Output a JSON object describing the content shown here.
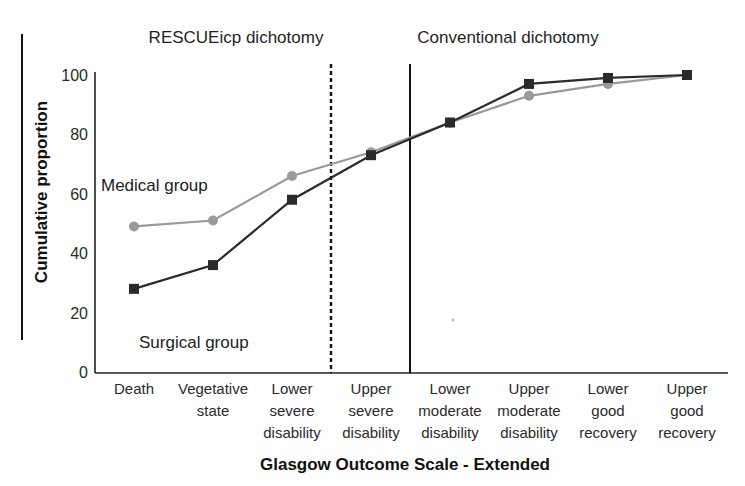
{
  "chart_data": {
    "type": "line",
    "title": "",
    "xlabel": "Glasgow Outcome Scale - Extended",
    "ylabel": "Cumulative proportion",
    "ylim": [
      0,
      100
    ],
    "yticks": [
      0,
      20,
      40,
      60,
      80,
      100
    ],
    "grid": false,
    "categories": [
      [
        "Death"
      ],
      [
        "Vegetative",
        "state"
      ],
      [
        "Lower",
        "severe",
        "disability"
      ],
      [
        "Upper",
        "severe",
        "disability"
      ],
      [
        "Lower",
        "moderate",
        "disability"
      ],
      [
        "Upper",
        "moderate",
        "disability"
      ],
      [
        "Lower",
        "good",
        "recovery"
      ],
      [
        "Upper",
        "good",
        "recovery"
      ]
    ],
    "category_labels": [
      "Death",
      "Vegetative state",
      "Lower severe disability",
      "Upper severe disability",
      "Lower moderate disability",
      "Upper moderate disability",
      "Lower good recovery",
      "Upper good recovery"
    ],
    "series": [
      {
        "name": "Medical group",
        "marker": "circle",
        "color": "#9a9a9a",
        "values": [
          49,
          51,
          66,
          74,
          84,
          93,
          97,
          100
        ]
      },
      {
        "name": "Surgical group",
        "marker": "square",
        "color": "#2b2b2b",
        "values": [
          28,
          36,
          58,
          73,
          84,
          97,
          99,
          100
        ]
      }
    ],
    "annotations": [
      {
        "text": "RESCUEicp dichotomy",
        "type": "region-label",
        "divider": "dashed",
        "divider_after_category": 3
      },
      {
        "text": "Conventional dichotomy",
        "type": "region-label",
        "divider": "solid",
        "divider_after_category": 3.5
      },
      {
        "text": "Medical group",
        "type": "series-label"
      },
      {
        "text": "Surgical group",
        "type": "series-label"
      }
    ],
    "legend": "none (inline series labels)"
  },
  "labels": {
    "region_left": "RESCUEicp dichotomy",
    "region_right": "Conventional dichotomy",
    "medical": "Medical group",
    "surgical": "Surgical group",
    "xtitle": "Glasgow Outcome Scale - Extended",
    "ytitle": "Cumulative proportion"
  }
}
